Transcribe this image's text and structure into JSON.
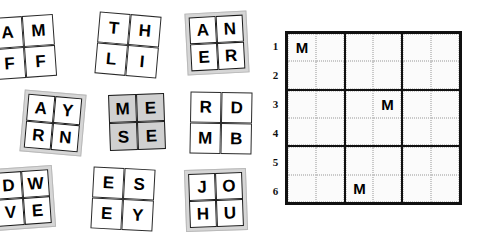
{
  "puzzle": {
    "title": "Letter tile placement puzzle",
    "tiles": [
      {
        "id": "tile-am-ff",
        "letters": [
          "A",
          "M",
          "F",
          "F"
        ],
        "style": "plain",
        "left": -7,
        "top": 16,
        "rotation": -4
      },
      {
        "id": "tile-th-li",
        "letters": [
          "T",
          "H",
          "L",
          "I"
        ],
        "style": "plain",
        "left": 97,
        "top": 14,
        "rotation": 5
      },
      {
        "id": "tile-an-er",
        "letters": [
          "A",
          "N",
          "E",
          "R"
        ],
        "style": "shaded",
        "left": 186,
        "top": 12,
        "rotation": -3
      },
      {
        "id": "tile-ay-rn",
        "letters": [
          "A",
          "Y",
          "R",
          "N"
        ],
        "style": "shaded",
        "left": 22,
        "top": 92,
        "rotation": 5
      },
      {
        "id": "tile-me-se",
        "letters": [
          "M",
          "E",
          "S",
          "E"
        ],
        "style": "graycells",
        "left": 106,
        "top": 91,
        "rotation": -2
      },
      {
        "id": "tile-rd-mb",
        "letters": [
          "R",
          "D",
          "M",
          "B"
        ],
        "style": "plain",
        "left": 190,
        "top": 92,
        "rotation": 1
      },
      {
        "id": "tile-dw-ve",
        "letters": [
          "D",
          "W",
          "V",
          "E"
        ],
        "style": "shaded",
        "left": -8,
        "top": 167,
        "rotation": -4
      },
      {
        "id": "tile-es-ey",
        "letters": [
          "E",
          "S",
          "E",
          "Y"
        ],
        "style": "plain",
        "left": 92,
        "top": 168,
        "rotation": 3
      },
      {
        "id": "tile-jo-hu",
        "letters": [
          "J",
          "O",
          "H",
          "U"
        ],
        "style": "shaded",
        "left": 185,
        "top": 169,
        "rotation": -2
      }
    ],
    "grid": {
      "rows": 6,
      "columns": 6,
      "block_rows": 2,
      "block_columns": 2,
      "row_labels": [
        "1",
        "2",
        "3",
        "4",
        "5",
        "6"
      ],
      "cells": [
        [
          "M",
          "",
          "",
          "",
          "",
          ""
        ],
        [
          "",
          "",
          "",
          "",
          "",
          ""
        ],
        [
          "",
          "",
          "",
          "M",
          "",
          ""
        ],
        [
          "",
          "",
          "",
          "",
          "",
          ""
        ],
        [
          "",
          "",
          "",
          "",
          "",
          ""
        ],
        [
          "",
          "",
          "M",
          "",
          "",
          ""
        ]
      ],
      "givens": [
        {
          "row": 1,
          "column": 1,
          "letter": "M"
        },
        {
          "row": 3,
          "column": 4,
          "letter": "M"
        },
        {
          "row": 6,
          "column": 3,
          "letter": "M"
        }
      ],
      "border_color": "#111111",
      "cell_guide_color": "#c9c9c9",
      "background": "#fbfbfb"
    },
    "colors": {
      "tile_shade": "#d6d6d6",
      "tile_gray_cell": "#d0d0d0",
      "cell_background": "#ffffff",
      "ink": "#000000"
    }
  }
}
